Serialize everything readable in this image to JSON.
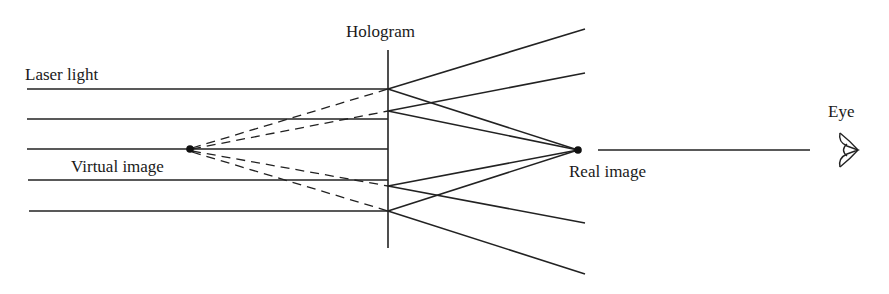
{
  "diagram": {
    "labels": {
      "laser_light": "Laser light",
      "hologram": "Hologram",
      "virtual_image": "Virtual image",
      "real_image": "Real image",
      "eye": "Eye"
    },
    "colors": {
      "line": "#222222",
      "text": "#1a1a1a",
      "background": "#ffffff"
    },
    "elements": {
      "laser_beams_count": 5,
      "hologram_plane": "vertical line",
      "virtual_image_rays": "dashed, diverging back from hologram",
      "real_image_rays": "solid, converging to real image point",
      "eye_icon": "eye-icon"
    }
  }
}
